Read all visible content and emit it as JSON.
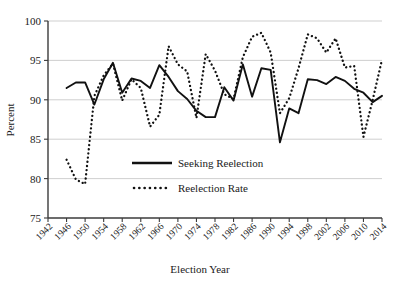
{
  "chart_data": {
    "type": "line",
    "title": "",
    "xlabel": "Election Year",
    "ylabel": "Percent",
    "ylim": [
      75,
      100
    ],
    "xlim": [
      1942,
      2014
    ],
    "yticks": [
      75,
      80,
      85,
      90,
      95,
      100
    ],
    "xticks": [
      1942,
      1946,
      1950,
      1954,
      1958,
      1962,
      1966,
      1970,
      1974,
      1978,
      1982,
      1986,
      1990,
      1994,
      1998,
      2002,
      2006,
      2010,
      2014
    ],
    "grid": "horizontal",
    "legend_position": "inside-center-left",
    "x": [
      1946,
      1948,
      1950,
      1952,
      1954,
      1956,
      1958,
      1960,
      1962,
      1964,
      1966,
      1968,
      1970,
      1972,
      1974,
      1976,
      1978,
      1980,
      1982,
      1984,
      1986,
      1988,
      1990,
      1992,
      1994,
      1996,
      1998,
      2000,
      2002,
      2004,
      2006,
      2008,
      2010,
      2012,
      2014
    ],
    "series": [
      {
        "name": "Seeking Reelection",
        "style": "solid",
        "color": "#111111",
        "values": [
          91.5,
          92.2,
          92.2,
          89.4,
          92.6,
          94.7,
          90.9,
          92.7,
          92.4,
          91.5,
          94.4,
          92.9,
          91.1,
          90.1,
          88.6,
          87.8,
          87.8,
          91.6,
          89.9,
          94.5,
          90.4,
          94.0,
          93.8,
          84.6,
          88.9,
          88.3,
          92.6,
          92.5,
          92.0,
          92.9,
          92.4,
          91.4,
          90.9,
          89.7,
          90.5
        ]
      },
      {
        "name": "Reelection Rate",
        "style": "dotted",
        "color": "#111111",
        "values": [
          82.4,
          79.9,
          79.3,
          90.5,
          93.1,
          94.6,
          89.9,
          92.6,
          91.5,
          86.6,
          88.1,
          96.8,
          94.5,
          93.6,
          87.7,
          95.8,
          93.7,
          90.7,
          90.1,
          95.4,
          98.0,
          98.5,
          96.0,
          88.3,
          90.2,
          94.0,
          98.3,
          97.8,
          96.0,
          97.8,
          94.1,
          94.3,
          85.3,
          90.0,
          95.1
        ]
      }
    ]
  }
}
